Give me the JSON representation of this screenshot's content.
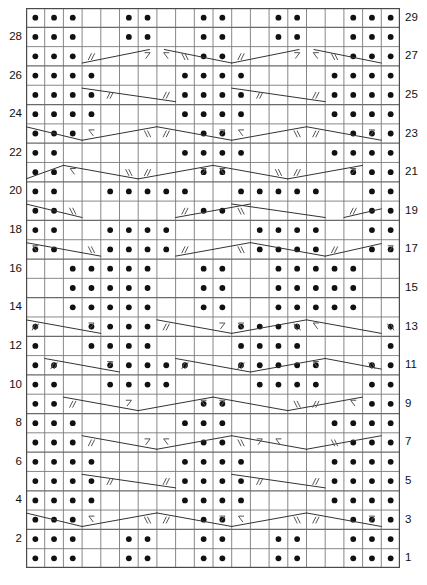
{
  "chart": {
    "type": "knitting-chart",
    "columns": 20,
    "rows": 29,
    "cell_width": 18.7,
    "cell_height": 19.31,
    "grid_origin": {
      "x": 26,
      "y": 8
    },
    "colors": {
      "grid_line": "#7a7a7a",
      "grid_line_major": "#6a6a6a",
      "border": "#4a4a4a",
      "dot": "#111111",
      "symbol": "#555555",
      "cable_line": "#333333",
      "background": "#ffffff",
      "label": "#111111"
    },
    "row_labels_left": [
      2,
      4,
      6,
      8,
      10,
      12,
      14,
      16,
      18,
      20,
      22,
      24,
      26,
      28
    ],
    "row_labels_right": [
      1,
      3,
      5,
      7,
      9,
      11,
      13,
      15,
      17,
      19,
      21,
      23,
      25,
      27,
      29
    ],
    "legend_note": "Dots = purl stitches; slashes and arrows = travelling / cable stitches",
    "symbols": {
      "dot": "purl-stitch",
      "double_slash_right": "twist-right",
      "double_slash_left": "twist-left",
      "arrow_right": "cable-cross-right",
      "arrow_left": "cable-cross-left",
      "diagonal": "travelling-stitch-line"
    }
  },
  "chart_data": {
    "type": "table",
    "xlabel": "Stitch column",
    "ylabel": "Row",
    "columns": 20,
    "rows": 29,
    "dot_rows": {
      "29": [
        1,
        2,
        3,
        6,
        7,
        10,
        11,
        14,
        15,
        18,
        19,
        20
      ],
      "28": [
        1,
        2,
        3,
        6,
        7,
        10,
        11,
        14,
        15,
        18,
        19,
        20
      ],
      "27": [
        1,
        2,
        3,
        10,
        11,
        18,
        19,
        20
      ],
      "26": [
        1,
        2,
        3,
        4,
        9,
        10,
        11,
        12,
        17,
        18,
        19,
        20
      ],
      "25": [
        1,
        2,
        3,
        4,
        9,
        10,
        11,
        12,
        17,
        18,
        19,
        20
      ],
      "24": [
        1,
        2,
        3,
        4,
        9,
        10,
        11,
        12,
        17,
        18,
        19,
        20
      ],
      "23": [
        1,
        2,
        3,
        10,
        11,
        18,
        19,
        20
      ],
      "22": [
        1,
        2,
        9,
        10,
        11,
        12,
        17,
        18,
        19,
        20
      ],
      "21": [
        1,
        2,
        10,
        11,
        18,
        19,
        20
      ],
      "20": [
        1,
        2,
        5,
        6,
        7,
        8,
        9,
        12,
        13,
        14,
        15,
        16,
        19,
        20
      ],
      "19": [
        1,
        2,
        10,
        11,
        19,
        20
      ],
      "18": [
        1,
        2,
        5,
        6,
        7,
        8,
        13,
        14,
        15,
        16,
        19,
        20
      ],
      "17": [
        1,
        2,
        5,
        6,
        7,
        8,
        13,
        14,
        15,
        16,
        19,
        20
      ],
      "16": [
        3,
        4,
        5,
        6,
        7,
        10,
        11,
        14,
        15,
        16,
        17,
        18
      ],
      "15": [
        3,
        4,
        5,
        6,
        7,
        10,
        11,
        14,
        15,
        16,
        17,
        18
      ],
      "14": [
        3,
        4,
        5,
        6,
        7,
        10,
        11,
        14,
        15,
        16,
        17,
        18
      ],
      "13": [
        1,
        4,
        5,
        6,
        7,
        12,
        13,
        14,
        15,
        20
      ],
      "12": [
        1,
        4,
        5,
        6,
        7,
        12,
        13,
        14,
        15,
        20
      ],
      "11": [
        1,
        2,
        5,
        6,
        7,
        8,
        9,
        12,
        13,
        14,
        15,
        16,
        19,
        20
      ],
      "10": [
        1,
        2,
        5,
        6,
        7,
        8,
        13,
        14,
        15,
        16,
        19,
        20
      ],
      "9": [
        1,
        2,
        10,
        11,
        19,
        20
      ],
      "8": [
        1,
        2,
        3,
        9,
        10,
        11,
        17,
        18,
        19,
        20
      ],
      "7": [
        1,
        2,
        3,
        10,
        11,
        18,
        19,
        20
      ],
      "6": [
        1,
        2,
        3,
        4,
        9,
        10,
        11,
        12,
        17,
        18,
        19,
        20
      ],
      "5": [
        1,
        2,
        3,
        4,
        9,
        10,
        11,
        12,
        17,
        18,
        19,
        20
      ],
      "4": [
        1,
        2,
        3,
        4,
        9,
        10,
        11,
        12,
        17,
        18,
        19,
        20
      ],
      "3": [
        1,
        2,
        3,
        10,
        11,
        18,
        19,
        20
      ],
      "2": [
        1,
        2,
        3,
        6,
        7,
        10,
        11,
        14,
        15,
        18,
        19,
        20
      ],
      "1": [
        1,
        2,
        3,
        6,
        7,
        10,
        11,
        14,
        15,
        18,
        19,
        20
      ]
    },
    "symbol_rows": {
      "27": [
        {
          "col": 4,
          "sym": "twist-right"
        },
        {
          "col": 7,
          "sym": "arrow-right"
        },
        {
          "col": 8,
          "sym": "arrow-left"
        },
        {
          "col": 9,
          "sym": "twist-left"
        },
        {
          "col": 12,
          "sym": "twist-right"
        },
        {
          "col": 15,
          "sym": "arrow-right"
        },
        {
          "col": 16,
          "sym": "arrow-left"
        },
        {
          "col": 17,
          "sym": "twist-left"
        }
      ],
      "25": [
        {
          "col": 5,
          "sym": "twist-right"
        },
        {
          "col": 8,
          "sym": "twist-right"
        },
        {
          "col": 13,
          "sym": "twist-right"
        },
        {
          "col": 16,
          "sym": "twist-right"
        }
      ],
      "23": [
        {
          "col": 4,
          "sym": "arrow-left"
        },
        {
          "col": 7,
          "sym": "twist-left"
        },
        {
          "col": 8,
          "sym": "twist-right"
        },
        {
          "col": 11,
          "sym": "arrow-right"
        },
        {
          "col": 12,
          "sym": "arrow-left"
        },
        {
          "col": 15,
          "sym": "twist-left"
        },
        {
          "col": 16,
          "sym": "twist-right"
        },
        {
          "col": 19,
          "sym": "arrow-right"
        }
      ],
      "21": [
        {
          "col": 3,
          "sym": "arrow-left"
        },
        {
          "col": 6,
          "sym": "twist-left"
        },
        {
          "col": 7,
          "sym": "twist-right"
        },
        {
          "col": 10,
          "sym": "arrow-right"
        },
        {
          "col": 11,
          "sym": "arrow-left"
        },
        {
          "col": 14,
          "sym": "twist-left"
        },
        {
          "col": 15,
          "sym": "twist-right"
        },
        {
          "col": 18,
          "sym": "arrow-right"
        }
      ],
      "19": [
        {
          "col": 3,
          "sym": "twist-left"
        },
        {
          "col": 9,
          "sym": "twist-right"
        },
        {
          "col": 12,
          "sym": "twist-left"
        },
        {
          "col": 18,
          "sym": "twist-right"
        }
      ],
      "17": [
        {
          "col": 1,
          "sym": "arrow-left"
        },
        {
          "col": 4,
          "sym": "twist-left"
        },
        {
          "col": 9,
          "sym": "twist-right"
        },
        {
          "col": 12,
          "sym": "twist-left"
        },
        {
          "col": 17,
          "sym": "twist-right"
        },
        {
          "col": 20,
          "sym": "arrow-right"
        }
      ],
      "13": [
        {
          "col": 1,
          "sym": "twist-right"
        },
        {
          "col": 4,
          "sym": "arrow-right"
        },
        {
          "col": 8,
          "sym": "twist-right"
        },
        {
          "col": 11,
          "sym": "arrow-right"
        },
        {
          "col": 12,
          "sym": "arrow-left"
        },
        {
          "col": 15,
          "sym": "twist-left"
        },
        {
          "col": 16,
          "sym": "arrow-left"
        },
        {
          "col": 20,
          "sym": "twist-left"
        }
      ],
      "11": [
        {
          "col": 2,
          "sym": "twist-right"
        },
        {
          "col": 5,
          "sym": "arrow-right"
        },
        {
          "col": 9,
          "sym": "twist-right"
        },
        {
          "col": 12,
          "sym": "twist-right"
        },
        {
          "col": 16,
          "sym": "arrow-left"
        },
        {
          "col": 19,
          "sym": "twist-left"
        }
      ],
      "9": [
        {
          "col": 3,
          "sym": "twist-right"
        },
        {
          "col": 6,
          "sym": "arrow-right"
        },
        {
          "col": 10,
          "sym": "arrow-left"
        },
        {
          "col": 11,
          "sym": "arrow-right"
        },
        {
          "col": 15,
          "sym": "twist-left"
        },
        {
          "col": 16,
          "sym": "twist-right"
        },
        {
          "col": 18,
          "sym": "arrow-left"
        }
      ],
      "7": [
        {
          "col": 4,
          "sym": "twist-right"
        },
        {
          "col": 7,
          "sym": "arrow-right"
        },
        {
          "col": 8,
          "sym": "arrow-left"
        },
        {
          "col": 12,
          "sym": "twist-left"
        },
        {
          "col": 13,
          "sym": "arrow-right"
        },
        {
          "col": 14,
          "sym": "arrow-left"
        },
        {
          "col": 17,
          "sym": "twist-left"
        }
      ],
      "5": [
        {
          "col": 5,
          "sym": "twist-right"
        },
        {
          "col": 8,
          "sym": "twist-right"
        },
        {
          "col": 13,
          "sym": "twist-right"
        },
        {
          "col": 16,
          "sym": "twist-right"
        }
      ],
      "3": [
        {
          "col": 4,
          "sym": "arrow-left"
        },
        {
          "col": 7,
          "sym": "twist-left"
        },
        {
          "col": 8,
          "sym": "twist-right"
        },
        {
          "col": 11,
          "sym": "arrow-right"
        },
        {
          "col": 12,
          "sym": "arrow-left"
        },
        {
          "col": 15,
          "sym": "twist-left"
        },
        {
          "col": 16,
          "sym": "twist-right"
        },
        {
          "col": 19,
          "sym": "arrow-right"
        }
      ]
    },
    "cable_lines": {
      "27": [
        [
          4.0,
          0.85,
          7.6,
          0.15
        ],
        [
          8.4,
          0.15,
          12.0,
          0.85
        ],
        [
          12.0,
          0.85,
          15.6,
          0.15
        ],
        [
          16.4,
          0.15,
          20.0,
          0.85
        ]
      ],
      "25": [
        [
          4.0,
          0.15,
          9.0,
          0.85
        ],
        [
          12.0,
          0.15,
          17.0,
          0.85
        ]
      ],
      "23": [
        [
          1.0,
          0.15,
          4.0,
          0.85
        ],
        [
          4.0,
          0.85,
          8.0,
          0.15
        ],
        [
          8.0,
          0.15,
          12.0,
          0.85
        ],
        [
          12.0,
          0.85,
          16.0,
          0.15
        ],
        [
          16.0,
          0.15,
          20.0,
          0.85
        ]
      ],
      "21": [
        [
          1.0,
          0.85,
          3.0,
          0.15
        ],
        [
          3.0,
          0.15,
          7.0,
          0.85
        ],
        [
          7.0,
          0.85,
          11.0,
          0.15
        ],
        [
          11.0,
          0.15,
          15.0,
          0.85
        ],
        [
          15.0,
          0.85,
          19.0,
          0.15
        ]
      ],
      "19": [
        [
          1.0,
          0.15,
          4.0,
          0.85
        ],
        [
          9.0,
          0.85,
          13.0,
          0.15
        ],
        [
          12.0,
          0.15,
          17.0,
          0.85
        ],
        [
          18.0,
          0.85,
          20.0,
          0.4
        ]
      ],
      "17": [
        [
          1.0,
          0.15,
          5.0,
          0.85
        ],
        [
          9.0,
          0.85,
          13.0,
          0.15
        ],
        [
          13.0,
          0.15,
          17.0,
          0.85
        ],
        [
          17.0,
          0.85,
          20.0,
          0.2
        ]
      ],
      "13": [
        [
          1.0,
          0.15,
          5.0,
          0.85
        ],
        [
          8.0,
          0.15,
          12.0,
          0.85
        ],
        [
          12.0,
          0.85,
          16.0,
          0.15
        ],
        [
          16.0,
          0.15,
          20.0,
          0.85
        ]
      ],
      "11": [
        [
          2.0,
          0.15,
          6.0,
          0.85
        ],
        [
          9.0,
          0.15,
          13.0,
          0.85
        ],
        [
          13.0,
          0.85,
          17.0,
          0.15
        ],
        [
          17.0,
          0.15,
          20.0,
          0.7
        ]
      ],
      "9": [
        [
          3.0,
          0.15,
          7.0,
          0.85
        ],
        [
          7.0,
          0.85,
          11.0,
          0.15
        ],
        [
          11.0,
          0.15,
          15.0,
          0.85
        ],
        [
          15.0,
          0.85,
          19.0,
          0.15
        ]
      ],
      "7": [
        [
          4.0,
          0.15,
          8.0,
          0.85
        ],
        [
          8.0,
          0.85,
          12.0,
          0.15
        ],
        [
          12.0,
          0.15,
          16.0,
          0.85
        ],
        [
          16.0,
          0.85,
          20.0,
          0.15
        ]
      ],
      "5": [
        [
          4.0,
          0.15,
          9.0,
          0.85
        ],
        [
          12.0,
          0.15,
          17.0,
          0.85
        ]
      ],
      "3": [
        [
          1.0,
          0.15,
          4.0,
          0.85
        ],
        [
          4.0,
          0.85,
          8.0,
          0.15
        ],
        [
          8.0,
          0.15,
          12.0,
          0.85
        ],
        [
          12.0,
          0.85,
          16.0,
          0.15
        ],
        [
          16.0,
          0.15,
          20.0,
          0.85
        ]
      ]
    }
  }
}
